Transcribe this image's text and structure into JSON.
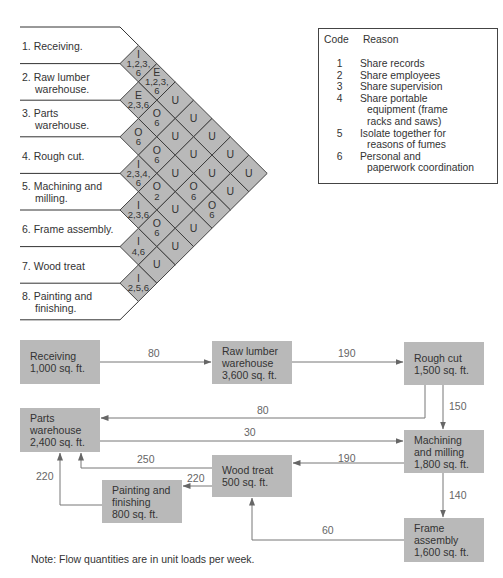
{
  "relationship_chart": {
    "departments": [
      {
        "num": "1.",
        "line1": "Receiving.",
        "line2": ""
      },
      {
        "num": "2.",
        "line1": "Raw lumber",
        "line2": "warehouse."
      },
      {
        "num": "3.",
        "line1": "Parts",
        "line2": "warehouse."
      },
      {
        "num": "4.",
        "line1": "Rough cut.",
        "line2": ""
      },
      {
        "num": "5.",
        "line1": "Machining and",
        "line2": "milling."
      },
      {
        "num": "6.",
        "line1": "Frame assembly.",
        "line2": ""
      },
      {
        "num": "7.",
        "line1": "Wood treat",
        "line2": ""
      },
      {
        "num": "8.",
        "line1": "Painting and",
        "line2": "finishing."
      }
    ],
    "cells": [
      {
        "from": 1,
        "to": 2,
        "rating": "I",
        "reasons": [
          "1,2,3,",
          "6"
        ]
      },
      {
        "from": 1,
        "to": 3,
        "rating": "E",
        "reasons": [
          "1,2,3,",
          "6"
        ]
      },
      {
        "from": 1,
        "to": 4,
        "rating": "U",
        "reasons": []
      },
      {
        "from": 1,
        "to": 5,
        "rating": "U",
        "reasons": []
      },
      {
        "from": 1,
        "to": 6,
        "rating": "U",
        "reasons": []
      },
      {
        "from": 1,
        "to": 7,
        "rating": "U",
        "reasons": []
      },
      {
        "from": 1,
        "to": 8,
        "rating": "U",
        "reasons": []
      },
      {
        "from": 2,
        "to": 3,
        "rating": "E",
        "reasons": [
          "2,3,6"
        ]
      },
      {
        "from": 2,
        "to": 4,
        "rating": "O",
        "reasons": [
          "6"
        ]
      },
      {
        "from": 2,
        "to": 5,
        "rating": "U",
        "reasons": []
      },
      {
        "from": 2,
        "to": 6,
        "rating": "U",
        "reasons": []
      },
      {
        "from": 2,
        "to": 7,
        "rating": "U",
        "reasons": []
      },
      {
        "from": 2,
        "to": 8,
        "rating": "U",
        "reasons": []
      },
      {
        "from": 3,
        "to": 4,
        "rating": "O",
        "reasons": [
          "6"
        ]
      },
      {
        "from": 3,
        "to": 5,
        "rating": "O",
        "reasons": [
          "6"
        ]
      },
      {
        "from": 3,
        "to": 6,
        "rating": "U",
        "reasons": []
      },
      {
        "from": 3,
        "to": 7,
        "rating": "O",
        "reasons": [
          "6"
        ]
      },
      {
        "from": 3,
        "to": 8,
        "rating": "O",
        "reasons": [
          "6"
        ]
      },
      {
        "from": 4,
        "to": 5,
        "rating": "I",
        "reasons": [
          "2,3,4,",
          "6"
        ]
      },
      {
        "from": 4,
        "to": 6,
        "rating": "O",
        "reasons": [
          "2"
        ]
      },
      {
        "from": 4,
        "to": 7,
        "rating": "U",
        "reasons": []
      },
      {
        "from": 4,
        "to": 8,
        "rating": "U",
        "reasons": []
      },
      {
        "from": 5,
        "to": 6,
        "rating": "I",
        "reasons": [
          "2,3,6"
        ]
      },
      {
        "from": 5,
        "to": 7,
        "rating": "O",
        "reasons": [
          "6"
        ]
      },
      {
        "from": 5,
        "to": 8,
        "rating": "U",
        "reasons": []
      },
      {
        "from": 6,
        "to": 7,
        "rating": "I",
        "reasons": [
          "4,6"
        ]
      },
      {
        "from": 6,
        "to": 8,
        "rating": "U",
        "reasons": []
      },
      {
        "from": 7,
        "to": 8,
        "rating": "I",
        "reasons": [
          "2,5,6"
        ]
      }
    ],
    "cell_color": "#b9b9b9",
    "line_color": "#333333"
  },
  "legend": {
    "code_header": "Code",
    "reason_header": "Reason",
    "items": [
      {
        "code": "1",
        "lines": [
          "Share records"
        ]
      },
      {
        "code": "2",
        "lines": [
          "Share employees"
        ]
      },
      {
        "code": "3",
        "lines": [
          "Share supervision"
        ]
      },
      {
        "code": "4",
        "lines": [
          "Share portable",
          "equipment (frame",
          "racks and saws)"
        ]
      },
      {
        "code": "5",
        "lines": [
          "Isolate together for",
          "reasons of fumes"
        ]
      },
      {
        "code": "6",
        "lines": [
          "Personal and",
          "paperwork coordination"
        ]
      }
    ]
  },
  "flow_diagram": {
    "box_color": "#b9b9b9",
    "boxes": {
      "receiving": {
        "lines": [
          "Receiving",
          "1,000 sq. ft."
        ]
      },
      "raw_lumber": {
        "lines": [
          "Raw lumber",
          "warehouse",
          "3,600 sq. ft."
        ]
      },
      "rough_cut": {
        "lines": [
          "Rough cut",
          "1,500 sq. ft."
        ]
      },
      "parts_warehouse": {
        "lines": [
          "Parts",
          "warehouse",
          "2,400 sq. ft."
        ]
      },
      "machining": {
        "lines": [
          "Machining",
          "and milling",
          "1,800 sq. ft."
        ]
      },
      "wood_treat": {
        "lines": [
          "Wood treat",
          "500 sq. ft."
        ]
      },
      "painting": {
        "lines": [
          "Painting and",
          "finishing",
          "800 sq. ft."
        ]
      },
      "frame_assembly": {
        "lines": [
          "Frame",
          "assembly",
          "1,600 sq. ft."
        ]
      }
    },
    "flows": {
      "receiving_to_raw": "80",
      "raw_to_rough": "190",
      "rough_to_parts": "80",
      "rough_to_machining": "150",
      "parts_to_machining": "30",
      "wood_to_parts": "250",
      "machining_to_wood": "190",
      "wood_to_painting": "220",
      "painting_to_parts": "220",
      "machining_to_frame": "140",
      "frame_to_wood": "60"
    },
    "note": "Note: Flow quantities are in unit loads per week."
  }
}
